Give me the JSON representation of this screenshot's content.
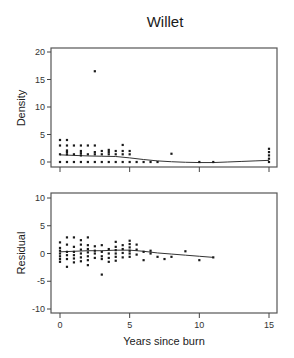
{
  "chart_data": [
    {
      "type": "scatter",
      "title": "Willet",
      "panel": "top",
      "xlabel": "",
      "ylabel": "Density",
      "xlim": [
        -0.8,
        15.5
      ],
      "ylim": [
        -0.8,
        20.5
      ],
      "xticks": [
        0,
        5,
        10,
        15
      ],
      "xtick_labels_shown": false,
      "yticks": [
        0,
        5,
        10,
        15,
        20
      ],
      "ytick_labels": [
        "0",
        "5",
        "10",
        "15",
        "20"
      ],
      "grid": false,
      "points": [
        [
          0,
          0
        ],
        [
          0,
          1.4
        ],
        [
          0,
          3
        ],
        [
          0,
          4
        ],
        [
          0.5,
          0
        ],
        [
          0.5,
          1.4
        ],
        [
          0.5,
          1.8
        ],
        [
          0.5,
          2.1
        ],
        [
          0.5,
          3
        ],
        [
          0.5,
          4
        ],
        [
          1,
          0
        ],
        [
          1,
          1.4
        ],
        [
          1,
          3
        ],
        [
          1.5,
          0
        ],
        [
          1.5,
          1.2
        ],
        [
          1.5,
          1.6
        ],
        [
          1.5,
          2
        ],
        [
          1.5,
          3
        ],
        [
          2,
          0
        ],
        [
          2,
          1.4
        ],
        [
          2,
          3
        ],
        [
          2.5,
          0
        ],
        [
          2.5,
          1.4
        ],
        [
          2.5,
          1.8
        ],
        [
          2.5,
          3
        ],
        [
          2.5,
          16.5
        ],
        [
          3,
          0
        ],
        [
          3,
          1.4
        ],
        [
          3,
          2
        ],
        [
          3.5,
          0
        ],
        [
          3.5,
          1.4
        ],
        [
          3.5,
          1.8
        ],
        [
          3.5,
          2.2
        ],
        [
          4,
          0
        ],
        [
          4,
          1.4
        ],
        [
          4,
          2
        ],
        [
          4.5,
          0
        ],
        [
          4.5,
          1.4
        ],
        [
          4.5,
          2
        ],
        [
          4.5,
          3.1
        ],
        [
          5,
          0
        ],
        [
          5,
          1.4
        ],
        [
          5,
          2
        ],
        [
          5.5,
          0
        ],
        [
          6,
          0
        ],
        [
          6.5,
          0
        ],
        [
          7,
          0
        ],
        [
          8,
          1.5
        ],
        [
          10,
          0
        ],
        [
          11,
          0
        ],
        [
          15,
          0
        ],
        [
          15,
          0.6
        ],
        [
          15,
          1.2
        ],
        [
          15,
          1.8
        ],
        [
          15,
          2.4
        ]
      ],
      "smoother": {
        "x": [
          0,
          1,
          2,
          3,
          4,
          5,
          6,
          7,
          8,
          9,
          10,
          11,
          12,
          13,
          14,
          15
        ],
        "y": [
          1.3,
          1.2,
          1.1,
          1.05,
          1.0,
          0.75,
          0.45,
          0.2,
          0.05,
          -0.05,
          -0.1,
          -0.1,
          0.0,
          0.1,
          0.2,
          0.3
        ]
      }
    },
    {
      "type": "scatter",
      "panel": "bottom",
      "title": "",
      "xlabel": "Years since burn",
      "ylabel": "Residual",
      "xlim": [
        -0.8,
        15.5
      ],
      "ylim": [
        -10.5,
        10.5
      ],
      "xticks": [
        0,
        5,
        10,
        15
      ],
      "xtick_labels": [
        "0",
        "5",
        "10",
        "15"
      ],
      "yticks": [
        -10,
        -5,
        0,
        5,
        10
      ],
      "ytick_labels": [
        "-10",
        "-5",
        "0",
        "5",
        "10"
      ],
      "grid": false,
      "points": [
        [
          0,
          2
        ],
        [
          0,
          1
        ],
        [
          0,
          0.5
        ],
        [
          0,
          0
        ],
        [
          0,
          -0.5
        ],
        [
          0,
          -1
        ],
        [
          0,
          -1.5
        ],
        [
          0.5,
          2.9
        ],
        [
          0.5,
          1.6
        ],
        [
          0.5,
          0.3
        ],
        [
          0.5,
          -0.3
        ],
        [
          0.5,
          -1
        ],
        [
          0.5,
          -2.4
        ],
        [
          1,
          2.9
        ],
        [
          1,
          1.2
        ],
        [
          1,
          0.3
        ],
        [
          1,
          -0.3
        ],
        [
          1,
          -0.9
        ],
        [
          1,
          -1.6
        ],
        [
          1.5,
          2.4
        ],
        [
          1.5,
          1.6
        ],
        [
          1.5,
          0.7
        ],
        [
          1.5,
          0
        ],
        [
          1.5,
          -0.7
        ],
        [
          1.5,
          -1.4
        ],
        [
          2,
          2.9
        ],
        [
          2,
          1.5
        ],
        [
          2,
          0.8
        ],
        [
          2,
          0.2
        ],
        [
          2,
          -0.5
        ],
        [
          2,
          -1.2
        ],
        [
          2,
          -2.1
        ],
        [
          2.5,
          1.3
        ],
        [
          2.5,
          0.5
        ],
        [
          2.5,
          0
        ],
        [
          2.5,
          -0.8
        ],
        [
          3,
          1.5
        ],
        [
          3,
          0.3
        ],
        [
          3,
          -0.5
        ],
        [
          3,
          -1
        ],
        [
          3,
          -3.8
        ],
        [
          3.5,
          0.8
        ],
        [
          3.5,
          0
        ],
        [
          3.5,
          -0.8
        ],
        [
          3.5,
          -1.5
        ],
        [
          4,
          2.1
        ],
        [
          4,
          1.2
        ],
        [
          4,
          0.6
        ],
        [
          4,
          0
        ],
        [
          4,
          -0.6
        ],
        [
          4,
          -1.3
        ],
        [
          4.5,
          1.5
        ],
        [
          4.5,
          0.8
        ],
        [
          4.5,
          0.1
        ],
        [
          4.5,
          -0.7
        ],
        [
          5,
          2.3
        ],
        [
          5,
          1.7
        ],
        [
          5,
          1.1
        ],
        [
          5,
          0.5
        ],
        [
          5,
          0
        ],
        [
          5,
          -0.6
        ],
        [
          5.5,
          1.6
        ],
        [
          5.5,
          0.7
        ],
        [
          5.5,
          -0.2
        ],
        [
          6,
          0.3
        ],
        [
          6,
          -1.2
        ],
        [
          6.5,
          0.5
        ],
        [
          6.5,
          0
        ],
        [
          7,
          -0.6
        ],
        [
          7.5,
          -1
        ],
        [
          8,
          -0.6
        ],
        [
          9,
          0.4
        ],
        [
          10,
          -1.2
        ],
        [
          11,
          -0.7
        ]
      ],
      "smoother": {
        "x": [
          0,
          1,
          2,
          3,
          4,
          5,
          6,
          7,
          8,
          9,
          10,
          11
        ],
        "y": [
          0.3,
          0.4,
          0.5,
          0.5,
          0.6,
          0.6,
          0.4,
          0.1,
          -0.1,
          -0.3,
          -0.5,
          -0.7
        ]
      }
    }
  ],
  "labels": {
    "title": "Willet",
    "top_ylabel": "Density",
    "bottom_ylabel": "Residual",
    "xlabel": "Years since burn"
  }
}
